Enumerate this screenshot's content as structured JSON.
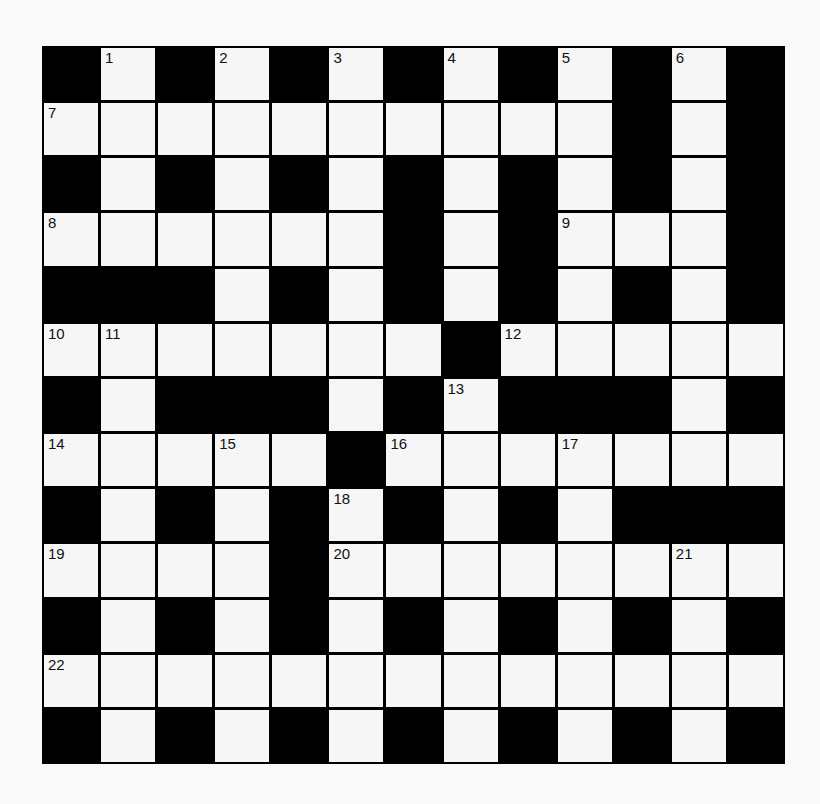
{
  "puzzle": {
    "type": "crossword",
    "rows": 13,
    "cols": 13,
    "colors": {
      "block": "#000000",
      "cell": "#f6f6f6",
      "background": "#f9f9f9",
      "number": "#111111"
    },
    "layout": [
      "#.#.#.#.#.#.#",
      "..........#.#",
      "#.#.#.#.#.#.#",
      "......#.#...#",
      "###.#.#.#.#.#",
      ".......#.....",
      "#.###.#.###.#",
      ".....#.......",
      "#.#.#.#.#.###",
      "....#........",
      "#.#.#.#.#.#.#",
      ".............",
      "#.#.#.#.#.#.#"
    ],
    "numbers": [
      {
        "row": 0,
        "col": 1,
        "n": "1"
      },
      {
        "row": 0,
        "col": 3,
        "n": "2"
      },
      {
        "row": 0,
        "col": 5,
        "n": "3"
      },
      {
        "row": 0,
        "col": 7,
        "n": "4"
      },
      {
        "row": 0,
        "col": 9,
        "n": "5"
      },
      {
        "row": 0,
        "col": 11,
        "n": "6"
      },
      {
        "row": 1,
        "col": 0,
        "n": "7"
      },
      {
        "row": 3,
        "col": 0,
        "n": "8"
      },
      {
        "row": 3,
        "col": 9,
        "n": "9"
      },
      {
        "row": 5,
        "col": 0,
        "n": "10"
      },
      {
        "row": 5,
        "col": 1,
        "n": "11"
      },
      {
        "row": 5,
        "col": 8,
        "n": "12"
      },
      {
        "row": 6,
        "col": 7,
        "n": "13"
      },
      {
        "row": 7,
        "col": 0,
        "n": "14"
      },
      {
        "row": 7,
        "col": 3,
        "n": "15"
      },
      {
        "row": 7,
        "col": 6,
        "n": "16"
      },
      {
        "row": 7,
        "col": 9,
        "n": "17"
      },
      {
        "row": 8,
        "col": 5,
        "n": "18"
      },
      {
        "row": 9,
        "col": 0,
        "n": "19"
      },
      {
        "row": 9,
        "col": 5,
        "n": "20"
      },
      {
        "row": 9,
        "col": 11,
        "n": "21"
      },
      {
        "row": 11,
        "col": 0,
        "n": "22"
      }
    ]
  }
}
